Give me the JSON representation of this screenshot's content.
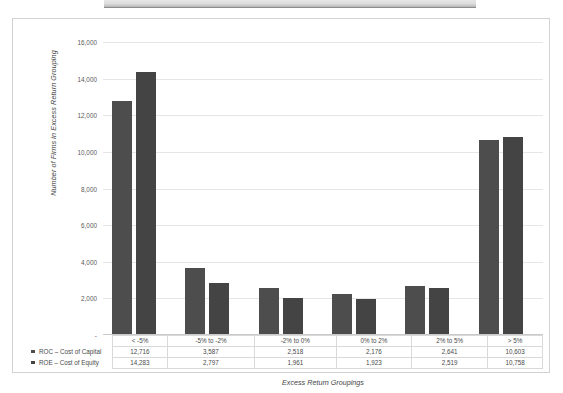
{
  "chart_data": {
    "type": "bar",
    "title": "",
    "xlabel": "Excess Return Groupings",
    "ylabel": "Number of Firms in Excess Return Grouping",
    "categories": [
      "< -5%",
      "-5% to -2%",
      "-2% to 0%",
      "0% to 2%",
      "2% to 5%",
      "> 5%"
    ],
    "series": [
      {
        "name": "ROC – Cost of Capital",
        "color": "#4d4d4d",
        "values": [
          12716,
          3587,
          2518,
          2176,
          2641,
          10603
        ]
      },
      {
        "name": "ROE – Cost of Equity",
        "color": "#444444",
        "values": [
          14283,
          2797,
          1961,
          1923,
          2519,
          10758
        ]
      }
    ],
    "value_labels": {
      "ROC – Cost of Capital": [
        "12,716",
        "3,587",
        "2,518",
        "2,176",
        "2,641",
        "10,603"
      ],
      "ROE – Cost of Equity": [
        "14,283",
        "2,797",
        "1,961",
        "1,923",
        "2,519",
        "10,758"
      ]
    },
    "ylim": [
      0,
      16000
    ],
    "ytick_values": [
      16000,
      14000,
      12000,
      10000,
      8000,
      6000,
      4000,
      2000,
      0
    ],
    "ytick_labels": [
      "16,000",
      "14,000",
      "12,000",
      "10,000",
      "8,000",
      "6,000",
      "4,000",
      "2,000",
      "-"
    ],
    "grid": true,
    "legend_position": "bottom-left-table",
    "data_table_visible": true
  }
}
